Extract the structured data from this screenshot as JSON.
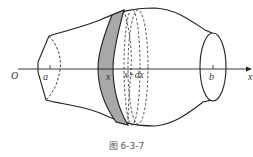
{
  "figure": {
    "caption": "图 6-3-7",
    "labels": {
      "origin": "O",
      "a": "a",
      "x": "x",
      "x_dx": "x+dx",
      "b": "b",
      "axis": "x"
    },
    "colors": {
      "stroke": "#222222",
      "slice_fill": "#a8a8a8",
      "background": "#ffffff"
    }
  }
}
